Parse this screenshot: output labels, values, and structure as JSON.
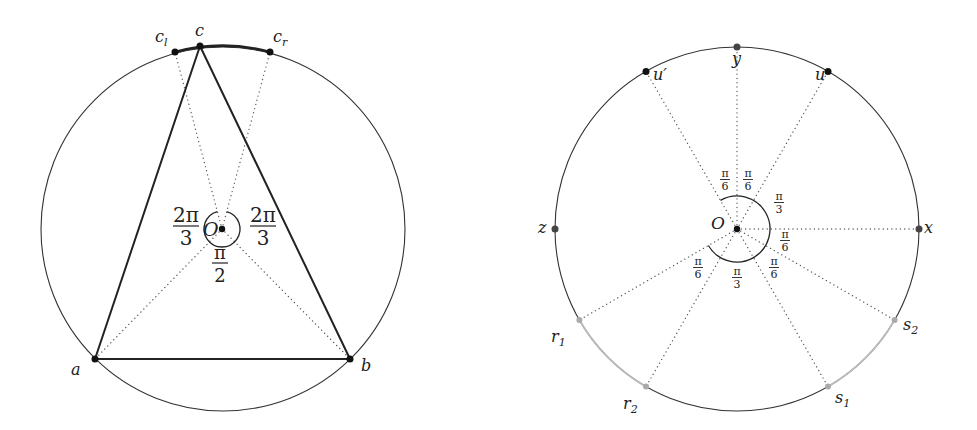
{
  "left_figure": {
    "center_label": "O",
    "points": {
      "c_l": {
        "main": "c",
        "sub": "l"
      },
      "c": {
        "main": "c"
      },
      "c_r": {
        "main": "c",
        "sub": "r"
      },
      "a": {
        "main": "a"
      },
      "b": {
        "main": "b"
      }
    },
    "angles": {
      "left": {
        "num": "2π",
        "den": "3"
      },
      "right": {
        "num": "2π",
        "den": "3"
      },
      "bottom": {
        "num": "π",
        "den": "2"
      }
    },
    "colors": {
      "circle": "#333333",
      "triangle": "#222222",
      "arc_highlight": "#222222"
    }
  },
  "right_figure": {
    "center_label": "O",
    "points": {
      "y": {
        "main": "y"
      },
      "u_prime": {
        "main": "u′"
      },
      "u": {
        "main": "u"
      },
      "z": {
        "main": "z"
      },
      "x": {
        "main": "x"
      },
      "r1": {
        "main": "r",
        "sub": "1"
      },
      "r2": {
        "main": "r",
        "sub": "2"
      },
      "s1": {
        "main": "s",
        "sub": "1"
      },
      "s2": {
        "main": "s",
        "sub": "2"
      }
    },
    "angles": {
      "top_left": {
        "num": "π",
        "den": "6"
      },
      "top_right": {
        "num": "π",
        "den": "6"
      },
      "upper_right": {
        "num": "π",
        "den": "3"
      },
      "right": {
        "num": "π",
        "den": "6"
      },
      "lower_right": {
        "num": "π",
        "den": "6"
      },
      "bottom": {
        "num": "π",
        "den": "3"
      },
      "lower_left": {
        "num": "π",
        "den": "6"
      }
    },
    "colors": {
      "circle": "#333333",
      "gray_arcs": "#bbbbbb",
      "gray_points": "#aaaaaa",
      "dark_points": "#444444",
      "black_points": "#111111"
    }
  }
}
